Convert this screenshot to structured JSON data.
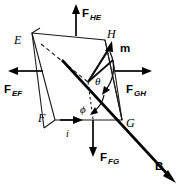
{
  "figure": {
    "type": "physics-force-diagram",
    "background_color": "#ffffff",
    "line_color": "#000000"
  },
  "vertices": [
    {
      "id": "E",
      "label": "E",
      "x": 32,
      "y": 33,
      "label_x": 16,
      "label_y": 42
    },
    {
      "id": "H",
      "label": "H",
      "x": 105,
      "y": 40,
      "label_x": 108,
      "label_y": 40
    },
    {
      "id": "G",
      "label": "G",
      "x": 122,
      "y": 120,
      "label_x": 126,
      "label_y": 126
    },
    {
      "id": "F",
      "label": "F",
      "x": 55,
      "y": 120,
      "label_x": 40,
      "label_y": 120
    }
  ],
  "force_vectors": [
    {
      "name": "F_HE",
      "label": "F",
      "subscript": "HE",
      "direction": "up",
      "tail_x": 76,
      "tail_y": 36,
      "tip_x": 76,
      "tip_y": 6,
      "label_x": 82,
      "label_y": 14
    },
    {
      "name": "F_EF",
      "label": "F",
      "subscript": "EF",
      "direction": "left",
      "tail_x": 43,
      "tail_y": 76,
      "tip_x": 8,
      "tip_y": 76,
      "label_x": 6,
      "label_y": 95
    },
    {
      "name": "F_GH",
      "label": "F",
      "subscript": "GH",
      "direction": "right",
      "tail_x": 113,
      "tail_y": 76,
      "tip_x": 152,
      "tip_y": 76,
      "label_x": 128,
      "label_y": 95
    },
    {
      "name": "F_FG",
      "label": "F",
      "subscript": "FG",
      "direction": "down",
      "tail_x": 93,
      "tail_y": 124,
      "tip_x": 93,
      "tip_y": 157,
      "label_x": 99,
      "label_y": 163
    }
  ],
  "field_vector": {
    "name": "B",
    "label": "B",
    "tail_x": 62,
    "tail_y": 60,
    "tip_x": 176,
    "tip_y": 183,
    "label_x": 155,
    "label_y": 167
  },
  "moment_vector": {
    "name": "m",
    "label": "m",
    "tail_x": 88,
    "tail_y": 82,
    "tip_x": 112,
    "tip_y": 42,
    "label_x": 122,
    "label_y": 50
  },
  "current": {
    "label": "i",
    "arrow_tail_x": 60,
    "arrow_tail_y": 122,
    "arrow_tip_x": 82,
    "arrow_tip_y": 122,
    "label_x": 68,
    "label_y": 137
  },
  "angles": [
    {
      "name": "theta",
      "label": "θ",
      "label_x": 97,
      "label_y": 81
    },
    {
      "name": "phi",
      "label": "ϕ",
      "label_x": 84,
      "label_y": 109
    }
  ]
}
